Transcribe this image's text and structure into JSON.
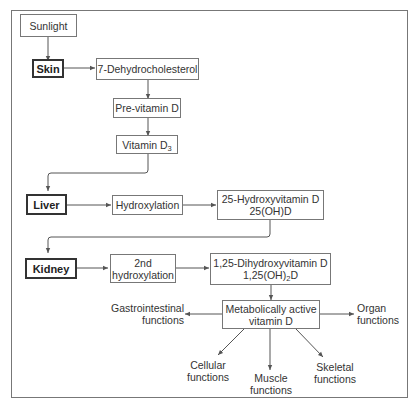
{
  "diagram": {
    "colors": {
      "line": "#555555",
      "box_border": "#777777",
      "organ_border": "#333333",
      "text": "#333333",
      "background": "#ffffff"
    },
    "nodes": {
      "sunlight": {
        "label": "Sunlight"
      },
      "skin": {
        "label": "Skin",
        "type": "organ"
      },
      "dehydrocholesterol": {
        "label": "7-Dehydrocholesterol"
      },
      "previtamin_d": {
        "label": "Pre-vitamin D"
      },
      "vitamin_d3": {
        "label": "Vitamin D",
        "subscript": "3"
      },
      "liver": {
        "label": "Liver",
        "type": "organ"
      },
      "hydroxylation": {
        "label": "Hydroxylation"
      },
      "hydroxyvitamin_d": {
        "line1": "25-Hydroxyvitamin D",
        "line2": "25(OH)D"
      },
      "kidney": {
        "label": "Kidney",
        "type": "organ"
      },
      "second_hydroxylation": {
        "line1": "2nd",
        "line2": "hydroxylation"
      },
      "dihydroxyvitamin_d": {
        "line1": "1,25-Dihydroxyvitamin D",
        "line2_prefix": "1,25(OH)",
        "line2_sub": "2",
        "line2_suffix": "D"
      },
      "active_vitamin_d": {
        "line1": "Metabolically active",
        "line2": "vitamin D"
      }
    },
    "outputs": {
      "gastrointestinal": {
        "line1": "Gastrointestinal",
        "line2": "functions"
      },
      "organ": {
        "line1": "Organ",
        "line2": "functions"
      },
      "cellular": {
        "line1": "Cellular",
        "line2": "functions"
      },
      "muscle": {
        "line1": "Muscle",
        "line2": "functions"
      },
      "skeletal": {
        "line1": "Skeletal",
        "line2": "functions"
      }
    },
    "edges": [
      [
        "Sunlight",
        "Skin"
      ],
      [
        "Skin",
        "7-Dehydrocholesterol"
      ],
      [
        "7-Dehydrocholesterol",
        "Pre-vitamin D"
      ],
      [
        "Pre-vitamin D",
        "Vitamin D3"
      ],
      [
        "Vitamin D3",
        "Liver"
      ],
      [
        "Liver",
        "Hydroxylation"
      ],
      [
        "Hydroxylation",
        "25-Hydroxyvitamin D"
      ],
      [
        "25-Hydroxyvitamin D",
        "Kidney"
      ],
      [
        "Kidney",
        "2nd hydroxylation"
      ],
      [
        "2nd hydroxylation",
        "1,25-Dihydroxyvitamin D"
      ],
      [
        "1,25-Dihydroxyvitamin D",
        "Metabolically active vitamin D"
      ],
      [
        "Metabolically active vitamin D",
        "Gastrointestinal functions"
      ],
      [
        "Metabolically active vitamin D",
        "Organ functions"
      ],
      [
        "Metabolically active vitamin D",
        "Cellular functions"
      ],
      [
        "Metabolically active vitamin D",
        "Muscle functions"
      ],
      [
        "Metabolically active vitamin D",
        "Skeletal functions"
      ]
    ]
  }
}
